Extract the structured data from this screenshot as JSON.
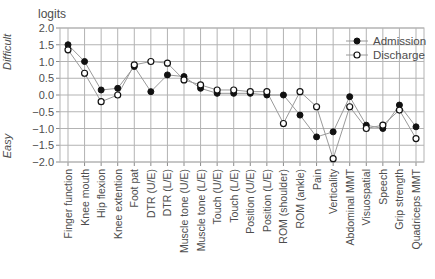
{
  "colors": {
    "grid": "#b3b3b3",
    "series_line": "#9a9a9a",
    "marker": "#111111",
    "text": "#4d4d4d",
    "background": "#ffffff"
  },
  "chart_data": {
    "type": "line",
    "title": "logits",
    "y_top_label": "Difficult",
    "y_bottom_label": "Easy",
    "ylim": [
      -2.0,
      2.0
    ],
    "ytick_step": 0.5,
    "grid": true,
    "legend_position": "top-right",
    "categories": [
      "Finger function",
      "Knee mouth",
      "Hip flexion",
      "Knee extention",
      "Foot pat",
      "DTR (U/E)",
      "DTR (L/E)",
      "Muscle tone (U/E)",
      "Muscle tone (L/E)",
      "Touch (U/E)",
      "Touch (L/E)",
      "Position (U/E)",
      "Position (L/E)",
      "ROM (shoulder)",
      "ROM (ankle)",
      "Pain",
      "Verticality",
      "Abdominal MMT",
      "Visuospatial",
      "Speech",
      "Grip strength",
      "Quadriceps MMT"
    ],
    "series": [
      {
        "name": "Admission",
        "marker": "filled-circle",
        "values": [
          1.5,
          1.0,
          0.15,
          0.2,
          0.85,
          0.1,
          0.6,
          0.55,
          0.2,
          0.05,
          0.05,
          0.05,
          0.0,
          0.0,
          -0.6,
          -1.25,
          -1.1,
          -0.05,
          -0.9,
          -1.0,
          -0.3,
          -0.95
        ]
      },
      {
        "name": "Discharge",
        "marker": "open-circle",
        "values": [
          1.35,
          0.65,
          -0.2,
          0.0,
          0.9,
          1.0,
          0.95,
          0.45,
          0.3,
          0.15,
          0.15,
          0.1,
          0.1,
          -0.85,
          0.1,
          -0.35,
          -1.9,
          -0.35,
          -1.0,
          -0.9,
          -0.45,
          -1.3
        ]
      }
    ]
  }
}
